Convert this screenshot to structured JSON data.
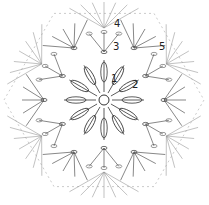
{
  "diagram": {
    "type": "crochet-chart",
    "shape": "hexagon",
    "center": [
      104,
      100
    ],
    "round_labels": [
      {
        "text": "1",
        "x": 111,
        "y": 74
      },
      {
        "text": "2",
        "x": 132,
        "y": 80
      },
      {
        "text": "3",
        "x": 113,
        "y": 42
      },
      {
        "text": "4",
        "x": 114,
        "y": 19
      },
      {
        "text": "5",
        "x": 159,
        "y": 42
      }
    ],
    "colors": {
      "stroke": "#555555",
      "dark": "#333333",
      "light": "#999999"
    }
  }
}
